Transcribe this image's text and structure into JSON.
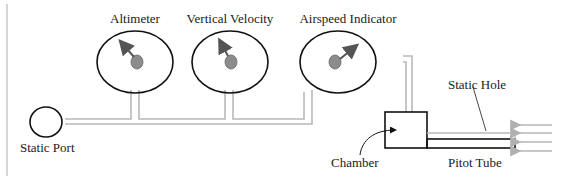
{
  "diagram": {
    "gauges": [
      {
        "label": "Altimeter",
        "needle": "up-left"
      },
      {
        "label": "Vertical Velocity",
        "needle": "up-left"
      },
      {
        "label": "Airspeed Indicator",
        "needle": "up-right"
      }
    ],
    "labels": {
      "static_port": "Static Port",
      "chamber": "Chamber",
      "static_hole": "Static Hole",
      "pitot_tube": "Pitot Tube"
    },
    "colors": {
      "outline": "#111111",
      "pipe": "#b8b8b8",
      "needle": "#555555",
      "hub": "#8c8c8c",
      "airflow_arrows": "#b0b0b0"
    }
  }
}
